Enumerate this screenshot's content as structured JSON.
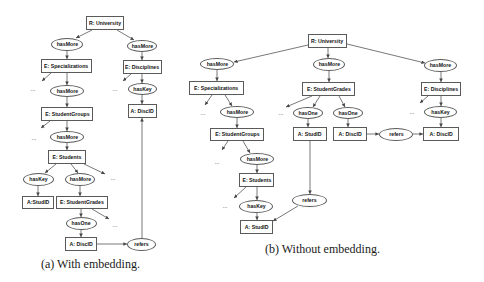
{
  "figure_a": {
    "caption": "(a) With embedding.",
    "ellipsis": "...",
    "nodes": [
      {
        "label": "R: University",
        "kind": "root"
      },
      {
        "label": "hasMore",
        "kind": "relation"
      },
      {
        "label": "hasMore",
        "kind": "relation"
      },
      {
        "label": "E: Specializations",
        "kind": "entity"
      },
      {
        "label": "E: Disciplines",
        "kind": "entity"
      },
      {
        "label": "hasMore",
        "kind": "relation"
      },
      {
        "label": "hasKey",
        "kind": "relation"
      },
      {
        "label": "E: StudentGroups",
        "kind": "entity"
      },
      {
        "label": "A: DiscID",
        "kind": "attribute"
      },
      {
        "label": "hasMore",
        "kind": "relation"
      },
      {
        "label": "E: Students",
        "kind": "entity"
      },
      {
        "label": "hasKey",
        "kind": "relation"
      },
      {
        "label": "hasMore",
        "kind": "relation"
      },
      {
        "label": "A:StudID",
        "kind": "attribute"
      },
      {
        "label": "E: StudentGrades",
        "kind": "entity"
      },
      {
        "label": "hasOne",
        "kind": "relation"
      },
      {
        "label": "A: DiscID",
        "kind": "attribute"
      },
      {
        "label": "refers",
        "kind": "relation"
      }
    ],
    "edges": [
      [
        0,
        1
      ],
      [
        0,
        2
      ],
      [
        1,
        3
      ],
      [
        2,
        4
      ],
      [
        3,
        5
      ],
      [
        4,
        6
      ],
      [
        6,
        8
      ],
      [
        5,
        7
      ],
      [
        7,
        9
      ],
      [
        9,
        10
      ],
      [
        10,
        11
      ],
      [
        10,
        12
      ],
      [
        11,
        13
      ],
      [
        12,
        14
      ],
      [
        14,
        15
      ],
      [
        15,
        16
      ],
      [
        16,
        17
      ],
      [
        17,
        8
      ]
    ]
  },
  "figure_b": {
    "caption": "(b) Without embedding.",
    "ellipsis": "...",
    "nodes": [
      {
        "label": "R: University",
        "kind": "root"
      },
      {
        "label": "hasMore",
        "kind": "relation"
      },
      {
        "label": "hasMore",
        "kind": "relation"
      },
      {
        "label": "hasMore",
        "kind": "relation"
      },
      {
        "label": "E: Specializations",
        "kind": "entity"
      },
      {
        "label": "E: StudentGrades",
        "kind": "entity"
      },
      {
        "label": "E: Disciplines",
        "kind": "entity"
      },
      {
        "label": "hasMore",
        "kind": "relation"
      },
      {
        "label": "hasOne",
        "kind": "relation"
      },
      {
        "label": "hasOne",
        "kind": "relation"
      },
      {
        "label": "hasKey",
        "kind": "relation"
      },
      {
        "label": "E: StudentGroups",
        "kind": "entity"
      },
      {
        "label": "A: StudID",
        "kind": "attribute"
      },
      {
        "label": "A: DiscID",
        "kind": "attribute"
      },
      {
        "label": "refers",
        "kind": "relation"
      },
      {
        "label": "A: DiscID",
        "kind": "attribute"
      },
      {
        "label": "hasMore",
        "kind": "relation"
      },
      {
        "label": "E: Students",
        "kind": "entity"
      },
      {
        "label": "hasKey",
        "kind": "relation"
      },
      {
        "label": "A: StudID",
        "kind": "attribute"
      },
      {
        "label": "refers",
        "kind": "relation"
      }
    ],
    "edges": [
      [
        0,
        1
      ],
      [
        0,
        2
      ],
      [
        0,
        3
      ],
      [
        1,
        4
      ],
      [
        2,
        5
      ],
      [
        3,
        6
      ],
      [
        4,
        7
      ],
      [
        5,
        8
      ],
      [
        5,
        9
      ],
      [
        6,
        10
      ],
      [
        7,
        11
      ],
      [
        8,
        12
      ],
      [
        9,
        13
      ],
      [
        10,
        15
      ],
      [
        13,
        14
      ],
      [
        14,
        15
      ],
      [
        11,
        16
      ],
      [
        16,
        17
      ],
      [
        17,
        18
      ],
      [
        18,
        19
      ],
      [
        12,
        20
      ],
      [
        20,
        19
      ]
    ]
  },
  "colors": {
    "stroke": "#5a5a5a",
    "text": "#111111",
    "background": "#ffffff"
  }
}
